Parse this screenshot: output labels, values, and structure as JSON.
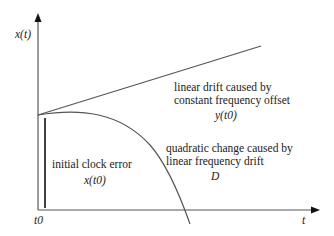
{
  "diagram": {
    "y_axis_label": "x(t)",
    "x_axis_label": "t",
    "origin_label": "t0",
    "linear_annotation": {
      "line1": "linear drift caused by",
      "line2": "constant frequency offset",
      "symbol": "y(t0)"
    },
    "quadratic_annotation": {
      "line1": "quadratic change caused by",
      "line2": "linear frequency drift",
      "symbol": "D"
    },
    "initial_annotation": {
      "line1": "initial clock error",
      "symbol": "x(t0)"
    },
    "colors": {
      "line": "#555555",
      "text": "#222222"
    }
  }
}
